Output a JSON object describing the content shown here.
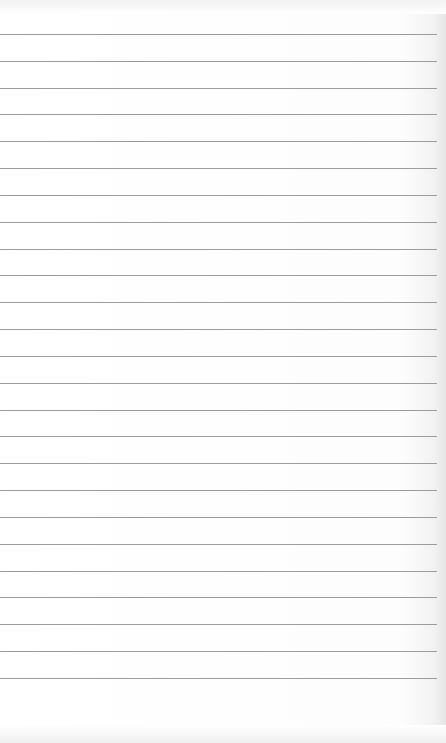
{
  "page": {
    "type": "lined-paper",
    "background_color": "#ffffff",
    "rule_color": "#9c9c9c",
    "rule_count": 25,
    "first_rule_y": 34,
    "rule_spacing": 26.83,
    "rule_width": 437
  }
}
